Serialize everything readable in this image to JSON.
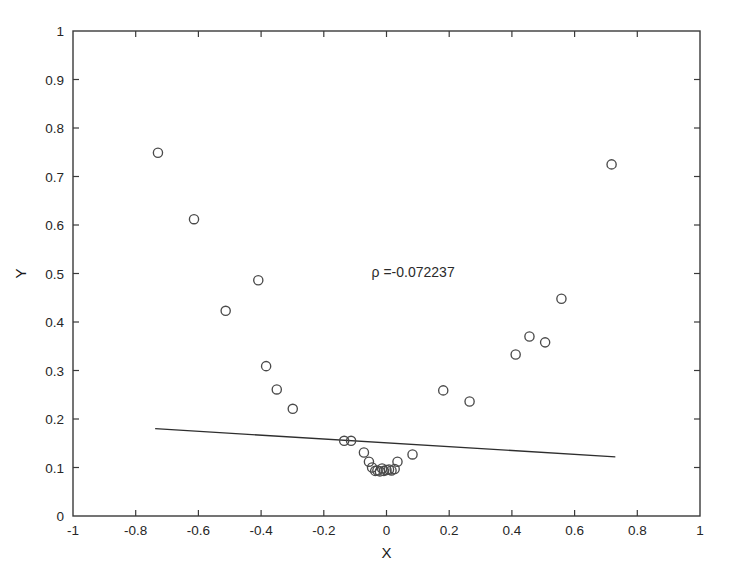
{
  "chart_data": {
    "type": "scatter",
    "title": "",
    "xlabel": "X",
    "ylabel": "Y",
    "xlim": [
      -1,
      1
    ],
    "ylim": [
      0,
      1
    ],
    "grid": false,
    "legend": null,
    "xticks": [
      "-1",
      "-0.8",
      "-0.6",
      "-0.4",
      "-0.2",
      "0",
      "0.2",
      "0.4",
      "0.6",
      "0.8",
      "1"
    ],
    "xtick_values": [
      -1,
      -0.8,
      -0.6,
      -0.4,
      -0.2,
      0,
      0.2,
      0.4,
      0.6,
      0.8,
      1
    ],
    "yticks": [
      "0",
      "0.1",
      "0.2",
      "0.3",
      "0.4",
      "0.5",
      "0.6",
      "0.7",
      "0.8",
      "0.9",
      "1"
    ],
    "ytick_values": [
      0,
      0.1,
      0.2,
      0.3,
      0.4,
      0.5,
      0.6,
      0.7,
      0.8,
      0.9,
      1
    ],
    "marker": "open-circle",
    "marker_radius_px": 4.6,
    "series": [
      {
        "name": "data",
        "points": [
          [
            -0.729,
            0.749
          ],
          [
            -0.614,
            0.612
          ],
          [
            -0.513,
            0.423
          ],
          [
            -0.409,
            0.486
          ],
          [
            -0.384,
            0.309
          ],
          [
            -0.35,
            0.261
          ],
          [
            -0.299,
            0.221
          ],
          [
            -0.135,
            0.155
          ],
          [
            -0.113,
            0.155
          ],
          [
            -0.072,
            0.131
          ],
          [
            -0.056,
            0.112
          ],
          [
            -0.046,
            0.1
          ],
          [
            -0.036,
            0.093
          ],
          [
            -0.029,
            0.094
          ],
          [
            -0.021,
            0.092
          ],
          [
            -0.014,
            0.098
          ],
          [
            -0.008,
            0.093
          ],
          [
            0.0,
            0.095
          ],
          [
            0.008,
            0.096
          ],
          [
            0.016,
            0.094
          ],
          [
            0.026,
            0.097
          ],
          [
            0.035,
            0.112
          ],
          [
            0.083,
            0.127
          ],
          [
            0.181,
            0.259
          ],
          [
            0.265,
            0.236
          ],
          [
            0.412,
            0.333
          ],
          [
            0.456,
            0.37
          ],
          [
            0.506,
            0.358
          ],
          [
            0.558,
            0.448
          ],
          [
            0.718,
            0.725
          ]
        ]
      }
    ],
    "fit_line": {
      "name": "least-squares fit",
      "x_start": -0.738,
      "y_start": 0.18,
      "x_end": 0.73,
      "y_end": 0.122
    },
    "annotations": [
      {
        "name": "correlation-annotation",
        "text": "ρ =-0.072237",
        "x": 0.085,
        "y": 0.492
      }
    ]
  }
}
